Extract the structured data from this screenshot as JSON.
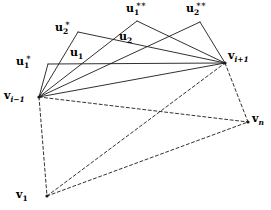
{
  "figure": {
    "width": 271,
    "height": 210,
    "background": "#ffffff",
    "stroke_color": "#1a1a1a",
    "stroke_width": 0.9,
    "dash_pattern": "3,2.5"
  },
  "points": {
    "v_im1": {
      "x": 39,
      "y": 97,
      "label_main": "v",
      "label_sub": "i−1",
      "label_sup": ""
    },
    "v_ip1": {
      "x": 225,
      "y": 63,
      "label_main": "v",
      "label_sub": "i+1",
      "label_sup": ""
    },
    "v_n": {
      "x": 248,
      "y": 122,
      "label_main": "v",
      "label_sub": "n",
      "label_sup": ""
    },
    "v_1": {
      "x": 47,
      "y": 196,
      "label_main": "v",
      "label_sub": "1",
      "label_sup": ""
    },
    "u1_star": {
      "x": 48,
      "y": 64,
      "label_main": "u",
      "label_sub": "1",
      "label_sup": "∗"
    },
    "u2_star": {
      "x": 78,
      "y": 32,
      "label_main": "u",
      "label_sub": "2",
      "label_sup": "∗"
    },
    "u1": {
      "x": 86,
      "y": 54,
      "label_main": "u",
      "label_sub": "1",
      "label_sup": ""
    },
    "u2": {
      "x": 131,
      "y": 39,
      "label_main": "u",
      "label_sub": "2",
      "label_sup": ""
    },
    "u1_dstar": {
      "x": 137,
      "y": 21,
      "label_main": "u",
      "label_sub": "1",
      "label_sup": "∗∗"
    },
    "u2_dstar": {
      "x": 200,
      "y": 22,
      "label_main": "u",
      "label_sub": "2",
      "label_sup": "∗∗"
    }
  },
  "labels": [
    {
      "name": "label-u1-star",
      "text": "u₁*",
      "main": "u",
      "sub": "1",
      "sup": "∗",
      "x": 16,
      "y": 56,
      "italic_sub": false
    },
    {
      "name": "label-u2-star",
      "text": "u₂*",
      "main": "u",
      "sub": "2",
      "sup": "∗",
      "x": 55,
      "y": 22,
      "italic_sub": false
    },
    {
      "name": "label-u1",
      "text": "u₁",
      "main": "u",
      "sub": "1",
      "sup": "",
      "x": 70,
      "y": 47,
      "italic_sub": false
    },
    {
      "name": "label-u2",
      "text": "u₂",
      "main": "u",
      "sub": "2",
      "sup": "",
      "x": 119,
      "y": 31,
      "italic_sub": false
    },
    {
      "name": "label-u1-dstar",
      "text": "u₁**",
      "main": "u",
      "sub": "1",
      "sup": "∗∗",
      "x": 126,
      "y": 3,
      "italic_sub": false
    },
    {
      "name": "label-u2-dstar",
      "text": "u₂**",
      "main": "u",
      "sub": "2",
      "sup": "∗∗",
      "x": 186,
      "y": 3,
      "italic_sub": false
    },
    {
      "name": "label-v-i-minus-1",
      "text": "vᵢ₋₁",
      "main": "v",
      "sub": "i−1",
      "sup": "",
      "x": 4,
      "y": 90,
      "italic_sub": true
    },
    {
      "name": "label-v-i-plus-1",
      "text": "vᵢ₊₁",
      "main": "v",
      "sub": "i+1",
      "sup": "",
      "x": 228,
      "y": 50,
      "italic_sub": true
    },
    {
      "name": "label-v-n",
      "text": "vₙ",
      "main": "v",
      "sub": "n",
      "sup": "",
      "x": 252,
      "y": 113,
      "italic_sub": true
    },
    {
      "name": "label-v-1",
      "text": "v₁",
      "main": "v",
      "sub": "1",
      "sup": "",
      "x": 16,
      "y": 189,
      "italic_sub": false
    }
  ],
  "edges": {
    "solid": [
      {
        "name": "edge-vim1-to-u1star",
        "from": "v_im1",
        "to": "u1_star"
      },
      {
        "name": "edge-vim1-to-u2star",
        "from": "v_im1",
        "to": "u2_star"
      },
      {
        "name": "edge-vim1-to-u1",
        "from": "v_im1",
        "to": "u1_dstar"
      },
      {
        "name": "edge-vim1-to-u2dstar",
        "from": "v_im1",
        "to": "u2_dstar"
      },
      {
        "name": "edge-vim1-to-vip1",
        "from": "v_im1",
        "to": "v_ip1"
      },
      {
        "name": "edge-u1star-to-vip1",
        "from": "u1_star",
        "to": "v_ip1"
      },
      {
        "name": "edge-u2star-to-vip1",
        "from": "u2_star",
        "to": "v_ip1"
      },
      {
        "name": "edge-u1dstar-to-vip1",
        "from": "u1_dstar",
        "to": "v_ip1"
      },
      {
        "name": "edge-u2dstar-to-vip1",
        "from": "u2_dstar",
        "to": "v_ip1"
      }
    ],
    "dashed": [
      {
        "name": "edge-vim1-to-vn",
        "from": "v_im1",
        "to": "v_n"
      },
      {
        "name": "edge-vim1-to-v1",
        "from": "v_im1",
        "to": "v_1"
      },
      {
        "name": "edge-v1-to-vn",
        "from": "v_1",
        "to": "v_n"
      },
      {
        "name": "edge-v1-to-vip1",
        "from": "v_1",
        "to": "v_ip1"
      },
      {
        "name": "edge-vip1-to-vn",
        "from": "v_ip1",
        "to": "v_n"
      }
    ]
  },
  "vertex_markers": [
    "v_im1",
    "v_ip1",
    "v_n",
    "v_1"
  ]
}
